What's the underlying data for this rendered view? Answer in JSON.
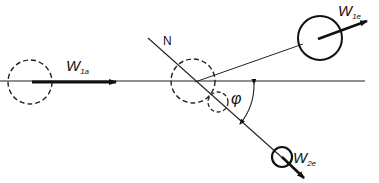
{
  "diagram": {
    "type": "collision-vector-diagram",
    "labels": {
      "w1a": {
        "main": "W",
        "sub": "1a"
      },
      "w1e": {
        "main": "W",
        "sub": "1e"
      },
      "w2e": {
        "main": "W",
        "sub": "2e"
      },
      "normal": "N",
      "angle": "φ"
    },
    "elements": [
      {
        "id": "incoming-ball",
        "style": "dashed",
        "description": "ball 1 before collision"
      },
      {
        "id": "impact-ball",
        "style": "dashed",
        "description": "ball 1 at impact"
      },
      {
        "id": "target-ball",
        "style": "dashed",
        "description": "ball 2 at rest"
      },
      {
        "id": "ball-1-after",
        "style": "solid",
        "description": "ball 1 after collision"
      },
      {
        "id": "ball-2-after",
        "style": "solid",
        "description": "ball 2 after collision"
      }
    ],
    "colors": {
      "ink": "#111111",
      "background": "#ffffff"
    }
  }
}
